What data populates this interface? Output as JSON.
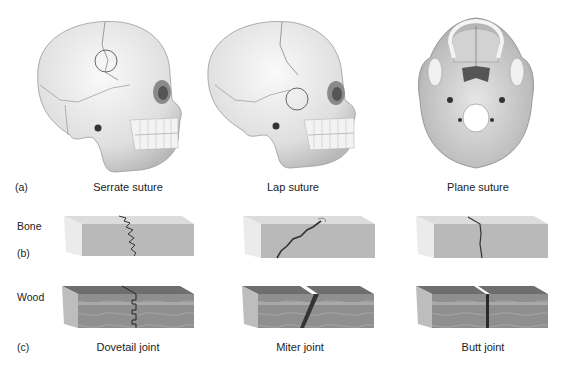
{
  "figure": {
    "rows": {
      "a": {
        "marker": "(a)"
      },
      "b": {
        "marker": "(b)",
        "side_label": "Bone"
      },
      "c": {
        "marker": "(c)",
        "side_label": "Wood"
      }
    },
    "sutures": [
      {
        "name": "Serrate suture",
        "view": "lateral skull",
        "highlight": "circle on coronal suture"
      },
      {
        "name": "Lap suture",
        "view": "lateral skull",
        "highlight": "circle on squamous suture"
      },
      {
        "name": "Plane suture",
        "view": "inferior skull base"
      }
    ],
    "bone_blocks": [
      {
        "joint_line": "serrated"
      },
      {
        "joint_line": "oblique"
      },
      {
        "joint_line": "straight"
      }
    ],
    "joints": [
      {
        "name": "Dovetail joint"
      },
      {
        "name": "Miter joint"
      },
      {
        "name": "Butt joint"
      }
    ],
    "colors": {
      "bone_front": "#b9b9b9",
      "bone_top": "#dcdcdc",
      "bone_side": "#ebebeb",
      "wood_front": "#8f8f8f",
      "wood_top": "#6e6e6e",
      "wood_side": "#bdbdbd",
      "line": "#333333"
    }
  }
}
